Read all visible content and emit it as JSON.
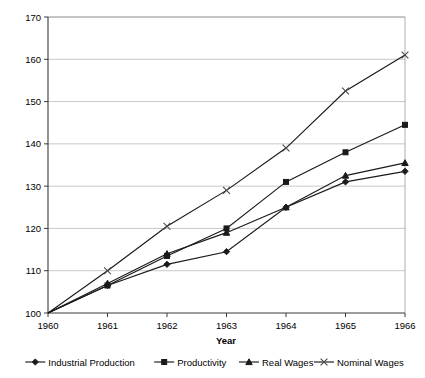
{
  "chart_data": {
    "type": "line",
    "title": "",
    "xlabel": "Year",
    "ylabel": "",
    "categories": [
      "1960",
      "1961",
      "1962",
      "1963",
      "1964",
      "1965",
      "1966"
    ],
    "x": [
      1960,
      1961,
      1962,
      1963,
      1964,
      1965,
      1966
    ],
    "xlim": [
      1960,
      1966
    ],
    "ylim": [
      100,
      170
    ],
    "ytick_labels": [
      "100",
      "110",
      "120",
      "130",
      "140",
      "150",
      "160",
      "170"
    ],
    "yticks": [
      100,
      110,
      120,
      130,
      140,
      150,
      160,
      170
    ],
    "grid": true,
    "legend_position": "bottom",
    "series": [
      {
        "name": "Industrial Production",
        "marker": "diamond",
        "values": [
          100,
          106.5,
          111.5,
          114.5,
          125,
          131,
          133.5
        ]
      },
      {
        "name": "Productivity",
        "marker": "square",
        "values": [
          100,
          106.5,
          113.5,
          120,
          131,
          138,
          144.5
        ]
      },
      {
        "name": "Real Wages",
        "marker": "triangle",
        "values": [
          100,
          107,
          114,
          119,
          125,
          132.5,
          135.5
        ]
      },
      {
        "name": "Nominal Wages",
        "marker": "cross-x",
        "values": [
          100,
          110,
          120.5,
          129,
          139,
          152.5,
          161
        ]
      }
    ]
  },
  "axes": {
    "x_axis_title": "Year",
    "y_tick_labels": [
      "100",
      "110",
      "120",
      "130",
      "140",
      "150",
      "160",
      "170"
    ],
    "x_tick_labels": [
      "1960",
      "1961",
      "1962",
      "1963",
      "1964",
      "1965",
      "1966"
    ]
  },
  "legend": {
    "items": [
      {
        "label": "Industrial Production",
        "marker": "diamond-marker-icon"
      },
      {
        "label": "Productivity",
        "marker": "square-marker-icon"
      },
      {
        "label": "Real Wages",
        "marker": "triangle-marker-icon"
      },
      {
        "label": "Nominal Wages",
        "marker": "x-marker-icon"
      }
    ]
  },
  "colors": {
    "series_stroke": "#1a1a1a",
    "nominal_stroke": "#4a4a4a",
    "gridline": "#b0b0b0",
    "axis": "#3a3a3a",
    "background": "#ffffff"
  }
}
